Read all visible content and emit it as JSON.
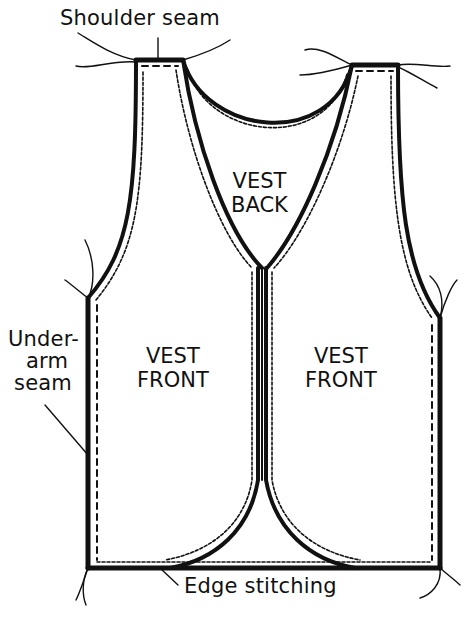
{
  "diagram": {
    "colors": {
      "ink": "#111111",
      "paper": "#ffffff"
    },
    "callouts": [
      {
        "id": "shoulder",
        "text": "Shoulder seam"
      },
      {
        "id": "underarm",
        "lines": [
          "Under-",
          "arm",
          "seam"
        ]
      },
      {
        "id": "edge",
        "text": "Edge stitching"
      }
    ],
    "pieces": {
      "back": {
        "lines": [
          "VEST",
          "BACK"
        ]
      },
      "front_left": {
        "lines": [
          "VEST",
          "FRONT"
        ]
      },
      "front_right": {
        "lines": [
          "VEST",
          "FRONT"
        ]
      }
    }
  }
}
